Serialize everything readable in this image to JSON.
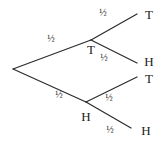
{
  "diagram": {
    "type": "probability-tree",
    "root": {
      "x": 13,
      "y": 69
    },
    "stage1": [
      {
        "id": "T",
        "label": "T",
        "prob": "½",
        "node": {
          "x": 91,
          "y": 40
        },
        "label_pos": {
          "x": 91,
          "y": 51
        },
        "prob_pos": {
          "x": 51,
          "y": 40
        }
      },
      {
        "id": "H",
        "label": "H",
        "prob": "½",
        "node": {
          "x": 86,
          "y": 102
        },
        "label_pos": {
          "x": 86,
          "y": 118
        },
        "prob_pos": {
          "x": 59,
          "y": 96
        }
      }
    ],
    "stage2": [
      {
        "parent": "T",
        "label": "T",
        "prob": "½",
        "end": {
          "x": 137,
          "y": 14
        },
        "label_pos": {
          "x": 149,
          "y": 16
        },
        "prob_pos": {
          "x": 103,
          "y": 14
        }
      },
      {
        "parent": "T",
        "label": "H",
        "prob": "½",
        "end": {
          "x": 137,
          "y": 63
        },
        "label_pos": {
          "x": 149,
          "y": 63
        },
        "prob_pos": {
          "x": 104,
          "y": 59
        }
      },
      {
        "parent": "H",
        "label": "T",
        "prob": "½",
        "end": {
          "x": 137,
          "y": 77
        },
        "label_pos": {
          "x": 149,
          "y": 80
        },
        "prob_pos": {
          "x": 109,
          "y": 99
        }
      },
      {
        "parent": "H",
        "label": "H",
        "prob": "½",
        "end": {
          "x": 131,
          "y": 128
        },
        "label_pos": {
          "x": 146,
          "y": 132
        },
        "prob_pos": {
          "x": 110,
          "y": 131
        }
      }
    ]
  }
}
